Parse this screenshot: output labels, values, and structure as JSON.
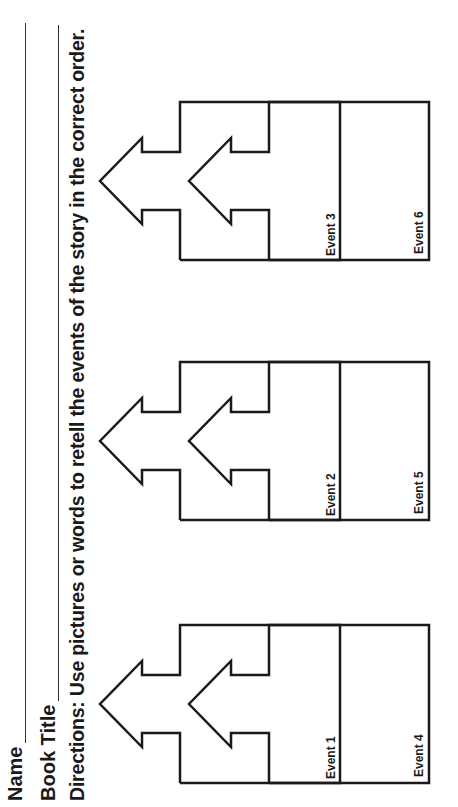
{
  "worksheet": {
    "name_label": "Name",
    "book_title_label": "Book Title",
    "directions": "Directions: Use pictures or words to retell the events of the story in the correct order."
  },
  "events": [
    {
      "label": "Event 1"
    },
    {
      "label": "Event 2"
    },
    {
      "label": "Event 3"
    },
    {
      "label": "Event 4"
    },
    {
      "label": "Event 5"
    },
    {
      "label": "Event 6"
    }
  ]
}
